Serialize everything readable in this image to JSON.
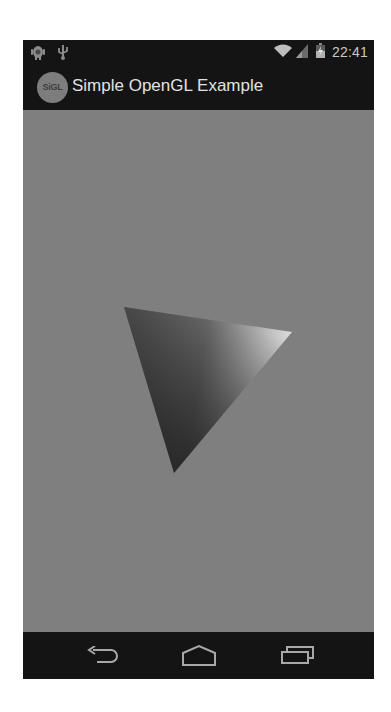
{
  "status_bar": {
    "left_icons": [
      "android-debug-icon",
      "usb-icon"
    ],
    "right_icons": [
      "wifi-icon",
      "cell-signal-icon",
      "battery-icon"
    ],
    "time": "22:41"
  },
  "action_bar": {
    "logo_text": "SiGL",
    "title": "Simple OpenGL Example"
  },
  "gl_surface": {
    "background_color": "#7f7f7f",
    "triangle": {
      "vertices": [
        [
          101,
          197
        ],
        [
          269,
          222
        ],
        [
          151,
          363
        ]
      ],
      "vertex_colors": [
        "#555555",
        "#d8d8d8",
        "#2e2e2e"
      ]
    }
  },
  "nav_bar": {
    "buttons": [
      {
        "name": "back",
        "icon": "back-icon"
      },
      {
        "name": "home",
        "icon": "home-icon"
      },
      {
        "name": "recents",
        "icon": "recents-icon"
      }
    ]
  },
  "colors": {
    "bars": "#141414",
    "title_text": "#e2e2e2",
    "icon_stroke": "#a8a8a8"
  }
}
